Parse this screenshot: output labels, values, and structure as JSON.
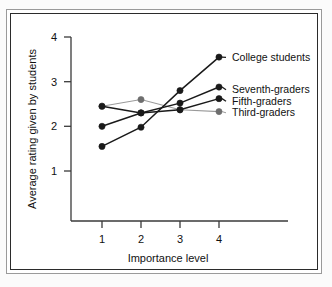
{
  "chart_data": {
    "type": "line",
    "title": "",
    "subtitle": "",
    "xlabel": "Importance level",
    "ylabel": "Average rating given by students",
    "x": [
      1,
      2,
      3,
      4
    ],
    "categories": [
      "1",
      "2",
      "3",
      "4"
    ],
    "xtick_labels": [
      "1",
      "2",
      "3",
      "4"
    ],
    "ytick_labels": [
      "1",
      "2",
      "3",
      "4"
    ],
    "xlim": [
      0.55,
      4.45
    ],
    "ylim": [
      0,
      4
    ],
    "grid": false,
    "legend_position": "right-inline",
    "series": [
      {
        "name": "College students",
        "values": [
          1.55,
          1.98,
          2.8,
          3.55
        ],
        "color": "#1a1a1a",
        "marker": "filled-circle",
        "marker_color": "#1a1a1a"
      },
      {
        "name": "Seventh-graders",
        "values": [
          2.0,
          2.3,
          2.52,
          2.88
        ],
        "color": "#1a1a1a",
        "marker": "filled-circle",
        "marker_color": "#1a1a1a"
      },
      {
        "name": "Fifth-graders",
        "values": [
          2.45,
          2.3,
          2.37,
          2.62
        ],
        "color": "#1a1a1a",
        "marker": "filled-circle",
        "marker_color": "#1a1a1a"
      },
      {
        "name": "Third-graders",
        "values": [
          2.45,
          2.6,
          2.37,
          2.33
        ],
        "color": "#9a9a9a",
        "marker": "filled-circle",
        "marker_color": "#6e6e6e"
      }
    ]
  },
  "axes": {
    "x_title": "Importance level",
    "y_title": "Average rating given by students",
    "x_ticks": [
      "1",
      "2",
      "3",
      "4"
    ],
    "y_ticks": [
      "4",
      "3",
      "2",
      "1"
    ]
  },
  "legend": {
    "items": [
      {
        "label": "College students"
      },
      {
        "label": "Seventh-graders"
      },
      {
        "label": "Fifth-graders"
      },
      {
        "label": "Third-graders"
      }
    ]
  },
  "colors": {
    "dark": "#1a1a1a",
    "light": "#9a9a9a",
    "frame_outer": "#9a9a9a",
    "frame_inner": "#2b2b2b",
    "background": "#ffffff",
    "page": "#fbfbfb"
  }
}
